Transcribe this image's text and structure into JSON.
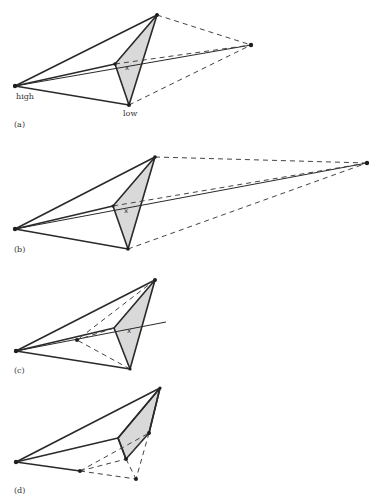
{
  "figure": {
    "panels": [
      {
        "id": "a",
        "label": "(a)",
        "vertex_labels": {
          "high": "high",
          "low": "low"
        },
        "centroid_mark": "x",
        "operation": "reflection"
      },
      {
        "id": "b",
        "label": "(b)",
        "centroid_mark": "x",
        "operation": "reflection and expansion"
      },
      {
        "id": "c",
        "label": "(c)",
        "centroid_mark": "x",
        "operation": "contraction"
      },
      {
        "id": "d",
        "label": "(d)",
        "operation": "multiple contraction"
      }
    ],
    "colors": {
      "line": "#2a2a2a",
      "face_fill": "#d9d9d9",
      "background": "#ffffff"
    }
  }
}
